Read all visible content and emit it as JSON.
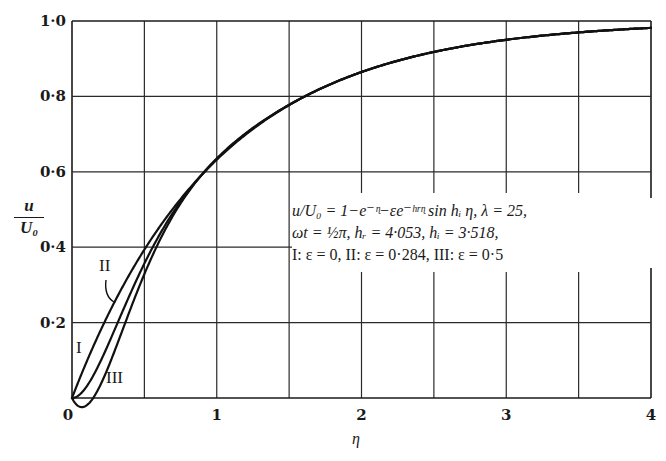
{
  "chart_data": {
    "type": "line",
    "title": "",
    "xlabel": "η",
    "ylabel": "u / U₀",
    "xlim": [
      0,
      4
    ],
    "ylim": [
      0,
      1.0
    ],
    "grid": true,
    "x_ticks": [
      0,
      0.5,
      1,
      1.5,
      2,
      2.5,
      3,
      3.5,
      4
    ],
    "x_tick_labels": [
      "0",
      "",
      "1",
      "",
      "2",
      "",
      "3",
      "",
      "4"
    ],
    "y_ticks": [
      0,
      0.2,
      0.4,
      0.6,
      0.8,
      1.0
    ],
    "y_tick_labels": [
      "0",
      "0·2",
      "0·4",
      "0·6",
      "0·8",
      "1·0"
    ],
    "formula": "u/U0 = 1 - e^(-η) - ε e^(-h_r η) sin(h_i η)",
    "parameters": {
      "lambda": 25,
      "omega_t": "½π",
      "h_r": 4.053,
      "h_i": 3.518
    },
    "series": [
      {
        "name": "I",
        "epsilon": 0,
        "x": [
          0,
          0.1,
          0.2,
          0.3,
          0.4,
          0.5,
          0.75,
          1.0,
          1.5,
          2.0,
          2.5,
          3.0,
          3.5,
          4.0
        ],
        "values": [
          0,
          0.095,
          0.181,
          0.259,
          0.33,
          0.393,
          0.528,
          0.632,
          0.777,
          0.865,
          0.918,
          0.95,
          0.97,
          0.982
        ]
      },
      {
        "name": "II",
        "epsilon": 0.284,
        "x": [
          0,
          0.1,
          0.2,
          0.3,
          0.4,
          0.5,
          0.75,
          1.0,
          1.5,
          2.0,
          2.5,
          3.0,
          3.5,
          4.0
        ],
        "values": [
          0,
          0.03,
          0.078,
          0.186,
          0.279,
          0.358,
          0.516,
          0.629,
          0.777,
          0.865,
          0.918,
          0.95,
          0.97,
          0.982
        ]
      },
      {
        "name": "III",
        "epsilon": 0.5,
        "x": [
          0,
          0.1,
          0.2,
          0.3,
          0.4,
          0.5,
          0.75,
          1.0,
          1.5,
          2.0,
          2.5,
          3.0,
          3.5,
          4.0
        ],
        "values": [
          0,
          -0.02,
          0.037,
          0.13,
          0.24,
          0.331,
          0.507,
          0.627,
          0.777,
          0.865,
          0.918,
          0.95,
          0.97,
          0.982
        ]
      }
    ],
    "annotations": [
      "u/U₀ = 1−e^(−η)−εe^(−h_r η) sin h_i η, λ = 25,",
      "ωt = ½π, h_r = 4·053, h_i = 3·518,",
      "I: ε = 0,   II: ε = 0·284,   III: ε = 0·5"
    ],
    "legend": "inline curve labels I, II, III"
  },
  "axes": {
    "y_label_num": "u",
    "y_label_den": "U₀",
    "x_label": "η",
    "y_ticks": [
      "1·0",
      "0·8",
      "0·6",
      "0·4",
      "0·2"
    ],
    "x_ticks": [
      "0",
      "1",
      "2",
      "3",
      "4"
    ]
  },
  "annotation": {
    "line1": "u/U₀ = 1−e⁻ᶯ−εe⁻ʰʳᶯ sin hᵢ η, λ = 25,",
    "line2": "ωt = ½π, hᵣ = 4·053, hᵢ = 3·518,",
    "line3": "I: ε = 0,   II: ε = 0·284,   III: ε = 0·5"
  },
  "curve_labels": {
    "I": "I",
    "II": "II",
    "III": "III"
  }
}
